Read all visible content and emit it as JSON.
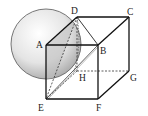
{
  "diagram": {
    "type": "cube-with-sphere",
    "vertices": {
      "A": {
        "label": "A",
        "x": 46,
        "y": 45
      },
      "B": {
        "label": "B",
        "x": 98,
        "y": 45
      },
      "C": {
        "label": "C",
        "x": 129,
        "y": 17
      },
      "D": {
        "label": "D",
        "x": 77,
        "y": 17
      },
      "E": {
        "label": "E",
        "x": 46,
        "y": 99
      },
      "F": {
        "label": "F",
        "x": 98,
        "y": 99
      },
      "G": {
        "label": "G",
        "x": 129,
        "y": 71
      },
      "H": {
        "label": "H",
        "x": 77,
        "y": 71
      }
    },
    "labels": {
      "A": "A",
      "B": "B",
      "C": "C",
      "D": "D",
      "E": "E",
      "F": "F",
      "G": "G",
      "H": "H"
    },
    "sphere": {
      "cx": 46,
      "cy": 44,
      "r": 35
    },
    "colors": {
      "line": "#222222",
      "sphere_fill": "#e8e8e8",
      "sphere_shadow": "#bdbdbd"
    }
  }
}
